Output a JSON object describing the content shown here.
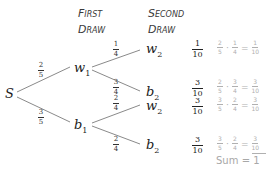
{
  "headers": {
    "first_draw_line1": "First",
    "first_draw_line2": "Draw",
    "second_draw_line1": "Second",
    "second_draw_line2": "Draw"
  },
  "nodes": {
    "start": "S",
    "w1_base": "w",
    "w1_sub": "1",
    "b1_base": "b",
    "b1_sub": "1",
    "w2a_base": "w",
    "w2a_sub": "2",
    "b2a_base": "b",
    "b2a_sub": "2",
    "w2b_base": "w",
    "w2b_sub": "2",
    "b2b_base": "b",
    "b2b_sub": "2"
  },
  "branch_probs": {
    "s_w1": {
      "num": "2",
      "den": "5"
    },
    "s_b1": {
      "num": "3",
      "den": "5"
    },
    "w1_w2": {
      "num": "1",
      "den": "4"
    },
    "w1_b2": {
      "num": "3",
      "den": "4"
    },
    "b1_w2": {
      "num": "2",
      "den": "4"
    },
    "b1_b2": {
      "num": "2",
      "den": "4"
    }
  },
  "outcomes": [
    {
      "prob": {
        "num": "1",
        "den": "10"
      },
      "a": {
        "num": "2",
        "den": "5"
      },
      "b": {
        "num": "1",
        "den": "4"
      },
      "res": {
        "num": "1",
        "den": "10"
      }
    },
    {
      "prob": {
        "num": "3",
        "den": "10"
      },
      "a": {
        "num": "2",
        "den": "5"
      },
      "b": {
        "num": "3",
        "den": "4"
      },
      "res": {
        "num": "3",
        "den": "10"
      }
    },
    {
      "prob": {
        "num": "3",
        "den": "10"
      },
      "a": {
        "num": "3",
        "den": "5"
      },
      "b": {
        "num": "2",
        "den": "4"
      },
      "res": {
        "num": "3",
        "den": "10"
      }
    },
    {
      "prob": {
        "num": "3",
        "den": "10"
      },
      "a": {
        "num": "3",
        "den": "5"
      },
      "b": {
        "num": "2",
        "den": "4"
      },
      "res": {
        "num": "3",
        "den": "10"
      }
    }
  ],
  "ops": {
    "dot": "·",
    "eq": "="
  },
  "sum": {
    "label": "Sum",
    "eq": "=",
    "value": "1"
  },
  "colors": {
    "line": "#8a8a8a",
    "text": "#222222",
    "faint": "#b0b0b0"
  }
}
